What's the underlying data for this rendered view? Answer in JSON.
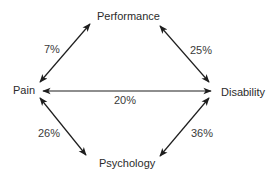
{
  "diagram": {
    "nodes": {
      "performance": "Performance",
      "pain": "Pain",
      "disability": "Disability",
      "psychology": "Psychology"
    },
    "edges": [
      {
        "from": "Pain",
        "to": "Performance",
        "label": "7%"
      },
      {
        "from": "Performance",
        "to": "Disability",
        "label": "25%"
      },
      {
        "from": "Pain",
        "to": "Disability",
        "label": "20%"
      },
      {
        "from": "Pain",
        "to": "Psychology",
        "label": "26%"
      },
      {
        "from": "Psychology",
        "to": "Disability",
        "label": "36%"
      }
    ],
    "style": {
      "arrow_color": "#1e1e1e",
      "text_color": "#2b2b2b",
      "background": "#ffffff"
    }
  }
}
